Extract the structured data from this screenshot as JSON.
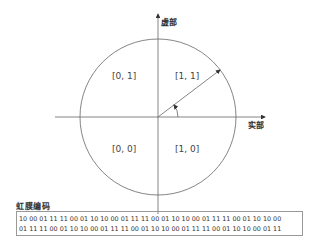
{
  "diagram": {
    "axes": {
      "imaginary_label": "虚部",
      "real_label": "实部"
    },
    "quadrants": [
      {
        "position": "top-left",
        "label": "[0, 1]"
      },
      {
        "position": "top-right",
        "label": "[1, 1]"
      },
      {
        "position": "bottom-left",
        "label": "[0, 0]"
      },
      {
        "position": "bottom-right",
        "label": "[1, 0]"
      }
    ],
    "elements": [
      "unit-circle",
      "phase-vector",
      "angle-arc"
    ]
  },
  "iris_code": {
    "title": "虹膜编码",
    "lines": [
      "10 00 01 11 11 00 01 10 10 00 01 11 11 00 01 10 10 00 01 11 11 00 01 10 10 00",
      "01 11 11 00 01 10 10 00 01 11 11 00 01 10 10 00 01 11 11 00 01 10 10 00 01 11"
    ]
  }
}
